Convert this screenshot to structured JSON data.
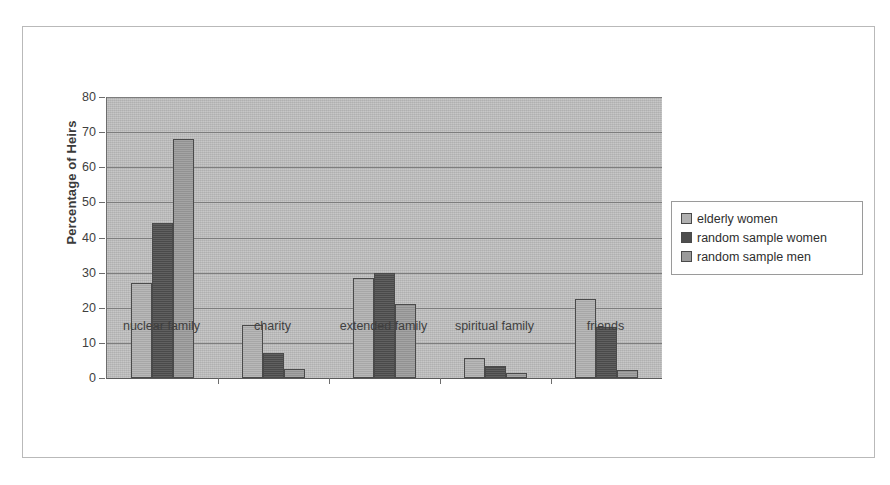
{
  "chart_data": {
    "type": "bar",
    "title": "",
    "xlabel": "",
    "ylabel": "Percentage of Heirs",
    "ylim": [
      0,
      80
    ],
    "ytick_step": 10,
    "yticks": [
      "80",
      "70",
      "60",
      "50",
      "40",
      "30",
      "20",
      "10",
      "0"
    ],
    "grid": true,
    "legend_position": "right",
    "categories": [
      "nuclear family",
      "charity",
      "extended family",
      "spiritual family",
      "friends"
    ],
    "series": [
      {
        "name": "elderly women",
        "color": "#b0b0b0",
        "values": [
          27,
          15,
          28.5,
          5.7,
          22.5
        ]
      },
      {
        "name": "random sample women",
        "color": "#4e4e4e",
        "values": [
          44,
          7,
          30,
          3.5,
          14.5
        ]
      },
      {
        "name": "random sample men",
        "color": "#9a9a9a",
        "values": [
          68,
          2.5,
          21,
          1.5,
          2.3
        ]
      }
    ]
  },
  "colors": {
    "plot_background": "#bcbcbc",
    "frame_border": "#b9b9b9",
    "gridline": "#7d7d7d",
    "bar_outline": "#4a4a4a",
    "axis_text": "#3f3f3f"
  }
}
